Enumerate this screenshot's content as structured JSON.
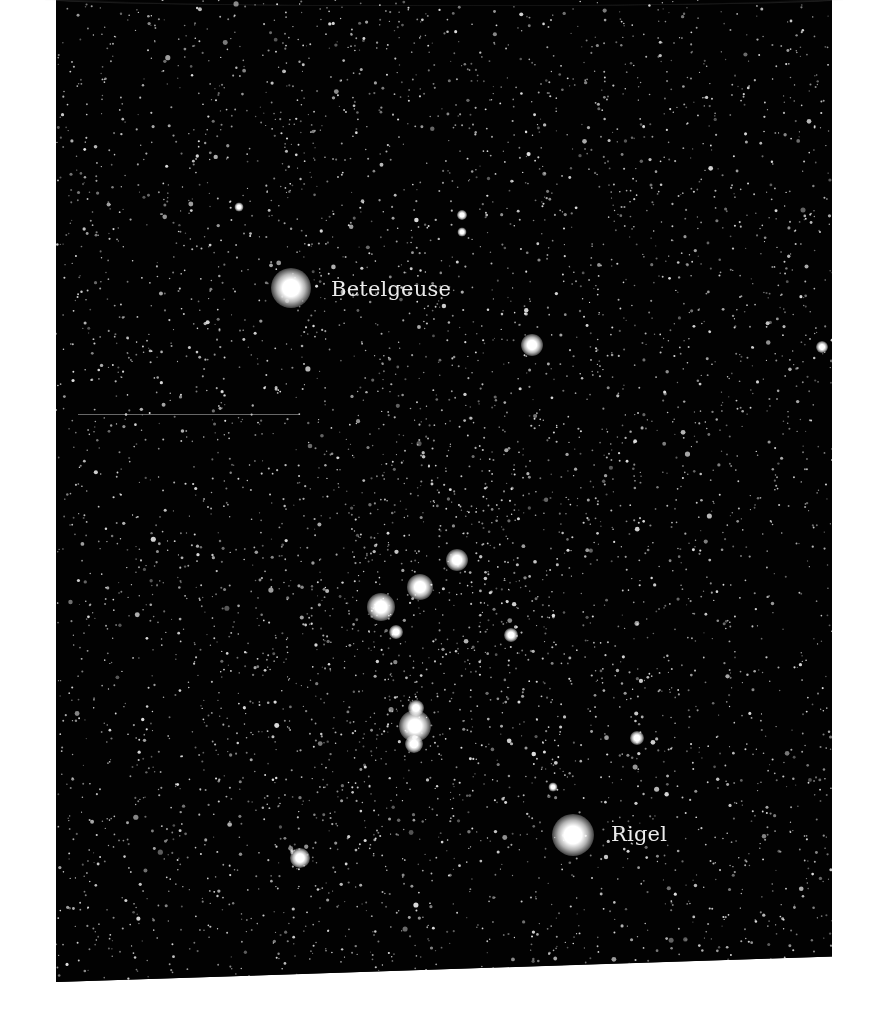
{
  "image": {
    "subject": "Orion constellation night-sky photograph",
    "background_color": "#020202",
    "page_color": "#ffffff"
  },
  "labels": {
    "betelgeuse": "Betelgeuse",
    "rigel": "Rigel"
  },
  "bright_stars": [
    {
      "name": "betelgeuse",
      "x": 235,
      "y": 288,
      "size": 40
    },
    {
      "name": "bellatrix",
      "x": 476,
      "y": 345,
      "size": 22
    },
    {
      "name": "belt-alnitak",
      "x": 325,
      "y": 607,
      "size": 28
    },
    {
      "name": "belt-alnilam",
      "x": 364,
      "y": 587,
      "size": 26
    },
    {
      "name": "belt-mintaka",
      "x": 401,
      "y": 560,
      "size": 22
    },
    {
      "name": "belt-sub",
      "x": 340,
      "y": 632,
      "size": 14
    },
    {
      "name": "star-right-belt",
      "x": 455,
      "y": 635,
      "size": 14
    },
    {
      "name": "nebula-upper",
      "x": 360,
      "y": 708,
      "size": 16
    },
    {
      "name": "nebula-main",
      "x": 359,
      "y": 726,
      "size": 32
    },
    {
      "name": "nebula-lower",
      "x": 358,
      "y": 744,
      "size": 18
    },
    {
      "name": "rigel",
      "x": 517,
      "y": 835,
      "size": 42
    },
    {
      "name": "saiph",
      "x": 244,
      "y": 858,
      "size": 20
    },
    {
      "name": "star-right-mid",
      "x": 581,
      "y": 738,
      "size": 14
    },
    {
      "name": "star-right-edge",
      "x": 766,
      "y": 347,
      "size": 12
    },
    {
      "name": "star-top-cluster-a",
      "x": 406,
      "y": 215,
      "size": 10
    },
    {
      "name": "star-top-cluster-b",
      "x": 406,
      "y": 232,
      "size": 9
    },
    {
      "name": "star-top-left",
      "x": 183,
      "y": 207,
      "size": 9
    },
    {
      "name": "star-lower-right",
      "x": 497,
      "y": 787,
      "size": 9
    }
  ]
}
